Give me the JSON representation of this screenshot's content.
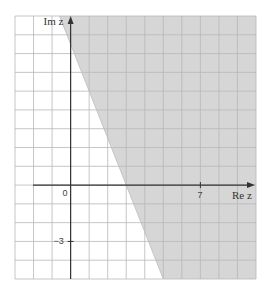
{
  "diagram": {
    "x_axis_label": "Re z",
    "y_axis_label": "Im z",
    "x_range": [
      -3,
      10
    ],
    "y_range": [
      -5,
      9
    ],
    "grid_step": 1,
    "tick_labels": {
      "origin": "0",
      "x": [
        {
          "value": 7,
          "label": "7"
        }
      ],
      "y": [
        {
          "value": -3,
          "label": "−3"
        }
      ]
    },
    "boundary_line": {
      "points": [
        [
          -0.6,
          9
        ],
        [
          5,
          -5
        ]
      ],
      "x_intercept": 3,
      "slope": -2.5
    },
    "shaded_side": "right",
    "colors": {
      "shade": "#d6d6d6",
      "grid": "#b8b8b8",
      "grid_shaded": "#9a9a9a",
      "axis": "#333333",
      "background": "#ffffff"
    }
  }
}
